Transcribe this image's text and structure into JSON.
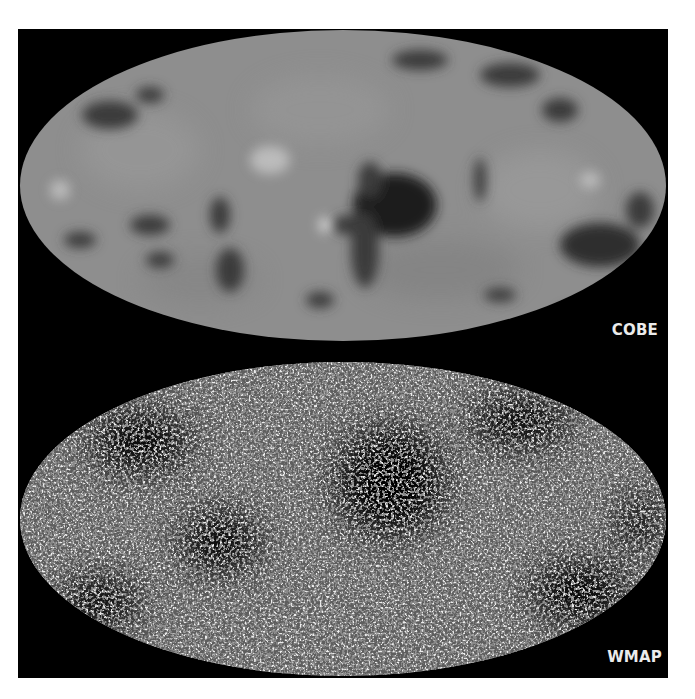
{
  "figure": {
    "panels": [
      {
        "id": "cobe",
        "label": "COBE",
        "description": "Full-sky Mollweide map of CMB temperature fluctuations, low resolution"
      },
      {
        "id": "wmap",
        "label": "WMAP",
        "description": "Full-sky Mollweide map of CMB temperature fluctuations, high resolution"
      }
    ],
    "colors": {
      "panel_background": "#000000",
      "page_background": "#ffffff",
      "map_base_gray": "#8e8e8e",
      "cold_spot": "#2a2a2a",
      "warm_spot": "#c8c8c8",
      "label_text": "#ebebeb"
    }
  }
}
